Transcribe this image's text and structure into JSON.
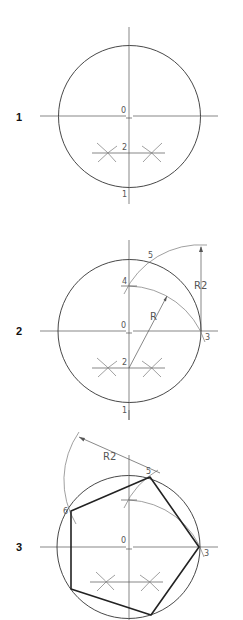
{
  "colors": {
    "background": "#ffffff",
    "line": "#333333",
    "construction": "#777777",
    "polygon": "#222222"
  },
  "steps": [
    {
      "number": "1",
      "points": {
        "center": "0",
        "bottom": "1",
        "midpoint": "2"
      }
    },
    {
      "number": "2",
      "points": {
        "center": "0",
        "bottom": "1",
        "midpoint": "2",
        "right": "3",
        "axis_point": "4",
        "top_arc": "5"
      },
      "dimensions": {
        "radius": "R",
        "radius2": "R2"
      }
    },
    {
      "number": "3",
      "points": {
        "center": "0",
        "right": "3",
        "vertex_top": "5",
        "vertex_left": "6"
      },
      "dimensions": {
        "radius2": "R2"
      }
    }
  ]
}
